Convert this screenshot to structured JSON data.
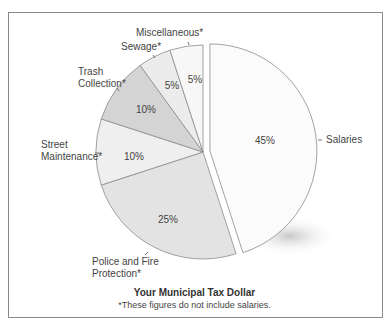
{
  "chart_data": {
    "type": "pie",
    "title": "Your Municipal Tax Dollar",
    "subtitle": "*These figures do not include salaries.",
    "categories": [
      "Salaries",
      "Police and Fire Protection*",
      "Street Maintenance*",
      "Trash Collection*",
      "Sewage*",
      "Miscellaneous*"
    ],
    "values": [
      45,
      25,
      10,
      10,
      5,
      5
    ],
    "unit": "%",
    "exploded": [
      "Salaries"
    ],
    "colors": [
      "#fbfbfb",
      "#e3e3e3",
      "#efefef",
      "#d4d4d4",
      "#ececec",
      "#f7f7f7"
    ],
    "legend": "none (callout labels)"
  },
  "labels": {
    "salaries": "Salaries",
    "police_line1": "Police and Fire",
    "police_line2": "Protection*",
    "street_line1": "Street",
    "street_line2": "Maintenance*",
    "trash_line1": "Trash",
    "trash_line2": "Collection*",
    "sewage": "Sewage*",
    "misc": "Miscellaneous*"
  },
  "percents": {
    "salaries": "45%",
    "police": "25%",
    "street": "10%",
    "trash": "10%",
    "sewage": "5%",
    "misc": "5%"
  },
  "caption": {
    "title": "Your Municipal Tax Dollar",
    "note": "*These figures do not include salaries."
  }
}
